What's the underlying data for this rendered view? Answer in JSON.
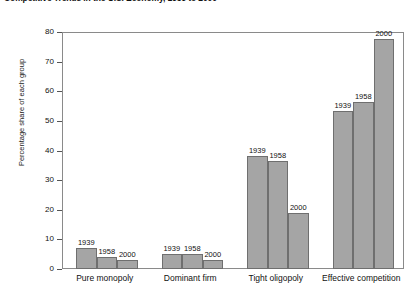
{
  "chart_data": {
    "type": "bar",
    "title": "Competitive Trends in the U.S. Economy, 1939 to 2000",
    "xlabel": "",
    "ylabel": "Percentage share of each group",
    "ylim": [
      0,
      80
    ],
    "yticks": [
      0,
      10,
      20,
      30,
      40,
      50,
      60,
      70,
      80
    ],
    "grid": false,
    "legend": "none",
    "bar_color": "#a5a5a5",
    "bar_border_color": "#6f6f6f",
    "categories": [
      "Pure monopoly",
      "Dominant firm",
      "Tight oligopoly",
      "Effective competition"
    ],
    "series": [
      {
        "name": "1939",
        "values": [
          7,
          5,
          38,
          53.5
        ]
      },
      {
        "name": "1958",
        "values": [
          4,
          5,
          36.5,
          56.5
        ]
      },
      {
        "name": "2000",
        "values": [
          3,
          3,
          19,
          77.5
        ]
      }
    ],
    "point_labels": [
      {
        "category": "Pure monopoly",
        "series": "1939",
        "label": "1939"
      },
      {
        "category": "Pure monopoly",
        "series": "1958",
        "label": "1958"
      },
      {
        "category": "Pure monopoly",
        "series": "2000",
        "label": "2000"
      },
      {
        "category": "Dominant firm",
        "series": "1939",
        "label": "1939"
      },
      {
        "category": "Dominant firm",
        "series": "1958",
        "label": "1958"
      },
      {
        "category": "Dominant firm",
        "series": "2000",
        "label": "2000"
      },
      {
        "category": "Tight oligopoly",
        "series": "1939",
        "label": "1939"
      },
      {
        "category": "Tight oligopoly",
        "series": "1958",
        "label": "1958"
      },
      {
        "category": "Tight oligopoly",
        "series": "2000",
        "label": "2000"
      },
      {
        "category": "Effective competition",
        "series": "1939",
        "label": "1939"
      },
      {
        "category": "Effective competition",
        "series": "1958",
        "label": "1958"
      },
      {
        "category": "Effective competition",
        "series": "2000",
        "label": "2000"
      }
    ]
  }
}
